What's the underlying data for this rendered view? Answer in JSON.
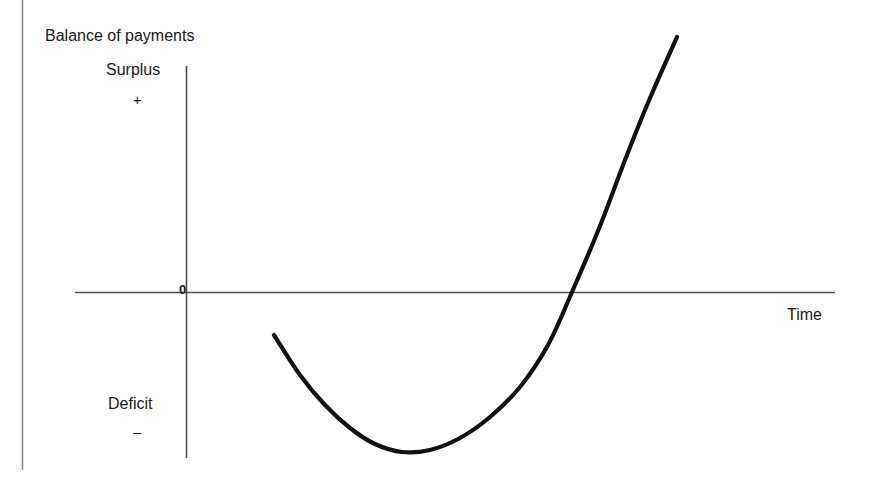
{
  "figure": {
    "title": "Balance of payments",
    "axes": {
      "y_top_label": "Surplus",
      "y_top_sign": "+",
      "y_bottom_label": "Deficit",
      "y_bottom_sign": "–",
      "x_label": "Time",
      "origin_label": "0"
    },
    "colors": {
      "curve": "#111111",
      "axis": "#4d4d4d",
      "frame": "#8c8c8c",
      "text": "#1a1a1a",
      "background": "#ffffff"
    }
  },
  "chart_data": {
    "type": "line",
    "title": "Balance of payments",
    "xlabel": "Time",
    "ylabel": "Balance of payments",
    "grid": false,
    "legend": null,
    "annotations": [
      "Surplus",
      "+",
      "Deficit",
      "–",
      "0"
    ],
    "axis_geometry": {
      "y_axis_x": 186,
      "y_axis_top": 66,
      "y_axis_bottom": 458,
      "x_axis_y": 292,
      "x_axis_left": 75,
      "x_axis_right": 835
    },
    "xlim": [
      0,
      1
    ],
    "ylim": [
      -1,
      1
    ],
    "series": [
      {
        "name": "J-curve",
        "stroke_width": 4.2,
        "points": [
          {
            "x": 274,
            "y": 335
          },
          {
            "x": 300,
            "y": 375
          },
          {
            "x": 325,
            "y": 405
          },
          {
            "x": 350,
            "y": 428
          },
          {
            "x": 375,
            "y": 444
          },
          {
            "x": 402,
            "y": 452
          },
          {
            "x": 430,
            "y": 450
          },
          {
            "x": 460,
            "y": 438
          },
          {
            "x": 490,
            "y": 417
          },
          {
            "x": 520,
            "y": 387
          },
          {
            "x": 548,
            "y": 345
          },
          {
            "x": 572,
            "y": 292
          },
          {
            "x": 600,
            "y": 226
          },
          {
            "x": 625,
            "y": 160
          },
          {
            "x": 650,
            "y": 98
          },
          {
            "x": 677,
            "y": 37
          }
        ],
        "key_points": {
          "start": {
            "x": 274,
            "y": 335,
            "meaning": "initial deficit after devaluation"
          },
          "trough": {
            "x": 402,
            "y": 452,
            "meaning": "maximum deficit"
          },
          "zero_crossing": {
            "x": 572,
            "y": 292,
            "meaning": "balance returns to zero"
          },
          "end": {
            "x": 677,
            "y": 37,
            "meaning": "surplus"
          }
        }
      }
    ]
  }
}
